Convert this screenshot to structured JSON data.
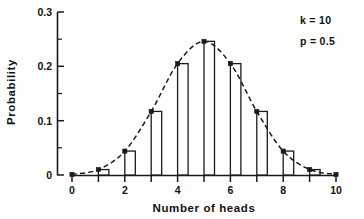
{
  "chart_data": {
    "type": "bar",
    "title": "",
    "subtitle": "",
    "xlabel": "Number of heads",
    "ylabel": "Probability",
    "categories": [
      "0",
      "1",
      "2",
      "3",
      "4",
      "5",
      "6",
      "7",
      "8",
      "9",
      "10"
    ],
    "x": [
      0,
      1,
      2,
      3,
      4,
      5,
      6,
      7,
      8,
      9,
      10
    ],
    "values": [
      0.001,
      0.01,
      0.044,
      0.117,
      0.205,
      0.246,
      0.205,
      0.117,
      0.044,
      0.01,
      0.001
    ],
    "series": [
      {
        "name": "Binomial probability",
        "values": [
          0.001,
          0.01,
          0.044,
          0.117,
          0.205,
          0.246,
          0.205,
          0.117,
          0.044,
          0.01,
          0.001
        ],
        "style": "bar"
      },
      {
        "name": "Fitted curve",
        "values": [
          0.001,
          0.01,
          0.044,
          0.117,
          0.205,
          0.246,
          0.205,
          0.117,
          0.044,
          0.01,
          0.001
        ],
        "style": "dashed-line-with-markers"
      }
    ],
    "xlim": [
      0,
      10
    ],
    "ylim": [
      0,
      0.3
    ],
    "xticks": [
      0,
      1,
      2,
      3,
      4,
      5,
      6,
      7,
      8,
      9,
      10
    ],
    "xtick_labels": [
      "0",
      "",
      "2",
      "",
      "4",
      "",
      "6",
      "",
      "8",
      "",
      "10"
    ],
    "yticks": [
      0,
      0.05,
      0.1,
      0.15,
      0.2,
      0.25,
      0.3
    ],
    "ytick_labels": [
      "0",
      "",
      "0.1",
      "",
      "0.2",
      "",
      "0.3"
    ],
    "grid": false,
    "legend": "none",
    "annotations": [
      {
        "name": "k-annotation",
        "text": "k = 10"
      },
      {
        "name": "p-annotation",
        "text": "p = 0.5"
      }
    ],
    "colors": {
      "axis": "#1a1a1a",
      "bar_fill": "#ffffff",
      "bar_stroke": "#1a1a1a",
      "curve": "#1a1a1a",
      "background": "#ffffff"
    }
  },
  "axes": {
    "x_title": "Number of heads",
    "y_title": "Probability",
    "y_labels": {
      "l0": "0",
      "l1": "0.1",
      "l2": "0.2",
      "l3": "0.3"
    },
    "x_labels": {
      "t0": "0",
      "t2": "2",
      "t4": "4",
      "t6": "6",
      "t8": "8",
      "t10": "10"
    }
  },
  "annotations": {
    "k_label": "k = 10",
    "p_label": "p = 0.5"
  }
}
